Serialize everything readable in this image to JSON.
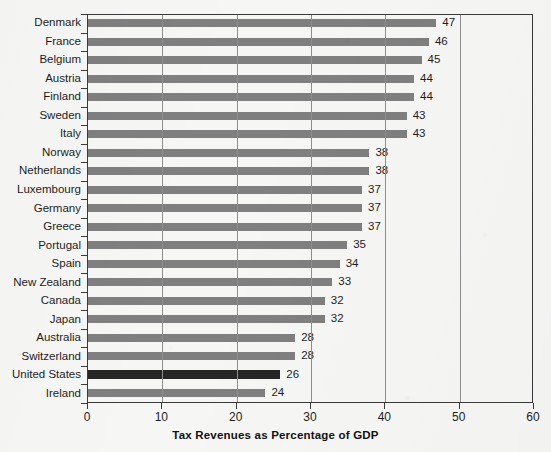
{
  "chart_data": {
    "type": "bar",
    "orientation": "horizontal",
    "title": "",
    "xlabel": "Tax Revenues as Percentage of GDP",
    "ylabel": "",
    "xlim": [
      0,
      60
    ],
    "xticks": [
      0,
      10,
      20,
      30,
      40,
      50,
      60
    ],
    "grid": "vertical",
    "legend": "none",
    "categories": [
      "Denmark",
      "France",
      "Belgium",
      "Austria",
      "Finland",
      "Sweden",
      "Italy",
      "Norway",
      "Netherlands",
      "Luxembourg",
      "Germany",
      "Greece",
      "Portugal",
      "Spain",
      "New Zealand",
      "Canada",
      "Japan",
      "Australia",
      "Switzerland",
      "United States",
      "Ireland"
    ],
    "values": [
      47,
      46,
      45,
      44,
      44,
      43,
      43,
      38,
      38,
      37,
      37,
      37,
      35,
      34,
      33,
      32,
      32,
      28,
      28,
      26,
      24
    ],
    "data_labels": [
      "47",
      "46",
      "45",
      "44",
      "44",
      "43",
      "43",
      "38",
      "38",
      "37",
      "37",
      "37",
      "35",
      "34",
      "33",
      "32",
      "32",
      "28",
      "28",
      "26",
      "24"
    ],
    "highlighted_category": "United States",
    "bar_color": "#7f7f7f",
    "highlight_color": "#262626",
    "axis_color": "#3a3a3a",
    "gridline_color": "#8e8e8e",
    "background_color": "#f6f6f5"
  }
}
